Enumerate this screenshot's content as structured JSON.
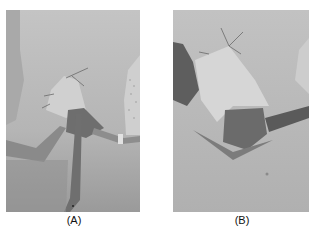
{
  "figure": {
    "panels": [
      {
        "label": "(A)",
        "description": "Grayscale surgical photograph: draped field, sutured skin flap retracted with metal retractors, instrument inserted into incision"
      },
      {
        "label": "(B)",
        "description": "Grayscale surgical photograph: close-up of retracted skin flap with sutures, exposed wound cavity and retractor"
      }
    ],
    "colors": {
      "background": "#ffffff",
      "label_text": "#111111",
      "photo_midtone": "#b9b9b9"
    }
  }
}
